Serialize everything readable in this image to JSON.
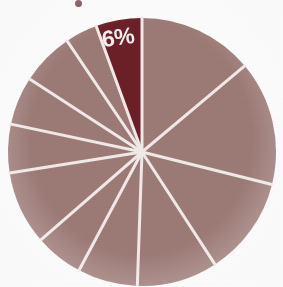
{
  "chart_data": {
    "type": "pie",
    "title": "",
    "subtitle": "",
    "xlabel": "",
    "ylabel": "",
    "legend_position": "none",
    "grid": false,
    "center": {
      "cx": 142,
      "cy": 152
    },
    "radius": 134,
    "slice_gap_color": "#f2ebe9",
    "slice_gap_width": 3,
    "categories": [
      "Slice 1",
      "Slice 2",
      "Slice 3",
      "Slice 4",
      "Slice 5",
      "Slice 6",
      "Slice 7",
      "Slice 8",
      "Slice 9",
      "Slice 10",
      "Slice 11",
      "Slice 12"
    ],
    "values": [
      14,
      15,
      12,
      10,
      7,
      6,
      9,
      6,
      6,
      7,
      6,
      6
    ],
    "labels": [
      "",
      "",
      "",
      "",
      "",
      "",
      "",
      "",
      "",
      "",
      "",
      "6%"
    ],
    "highlight_index": 11,
    "start_angle_deg": 0,
    "direction": "clockwise",
    "slices": [
      {
        "name": "Slice 1",
        "value": 14,
        "label": "",
        "start_deg": 0,
        "end_deg": 50,
        "color": "#9d7b77",
        "highlighted": false
      },
      {
        "name": "Slice 2",
        "value": 15,
        "label": "",
        "start_deg": 50,
        "end_deg": 104,
        "color": "#9d7b77",
        "highlighted": false
      },
      {
        "name": "Slice 3",
        "value": 12,
        "label": "",
        "start_deg": 104,
        "end_deg": 147,
        "color": "#9d7b77",
        "highlighted": false
      },
      {
        "name": "Slice 4",
        "value": 10,
        "label": "",
        "start_deg": 147,
        "end_deg": 182,
        "color": "#9d7b77",
        "highlighted": false
      },
      {
        "name": "Slice 5",
        "value": 7,
        "label": "",
        "start_deg": 182,
        "end_deg": 208,
        "color": "#9d7b77",
        "highlighted": false
      },
      {
        "name": "Slice 6",
        "value": 6,
        "label": "",
        "start_deg": 208,
        "end_deg": 229,
        "color": "#9d7b77",
        "highlighted": false
      },
      {
        "name": "Slice 7",
        "value": 9,
        "label": "",
        "start_deg": 229,
        "end_deg": 261,
        "color": "#9d7b77",
        "highlighted": false
      },
      {
        "name": "Slice 8",
        "value": 6,
        "label": "",
        "start_deg": 261,
        "end_deg": 282,
        "color": "#9d7b77",
        "highlighted": false
      },
      {
        "name": "Slice 9",
        "value": 6,
        "label": "",
        "start_deg": 282,
        "end_deg": 303,
        "color": "#9d7b77",
        "highlighted": false
      },
      {
        "name": "Slice 10",
        "value": 7,
        "label": "",
        "start_deg": 303,
        "end_deg": 326,
        "color": "#9d7b77",
        "highlighted": false
      },
      {
        "name": "Slice 11",
        "value": 6,
        "label": "",
        "start_deg": 326,
        "end_deg": 340,
        "color": "#9d7b77",
        "highlighted": false
      },
      {
        "name": "Slice 12",
        "value": 6,
        "label": "6%",
        "start_deg": 340,
        "end_deg": 360,
        "color": "#6b2028",
        "highlighted": true
      }
    ],
    "colors": {
      "primary_slice": "#9d7b77",
      "highlight_slice": "#6b2028",
      "separator": "#f2ebe9",
      "label_text": "#f4f0ef",
      "background": "#fdfdfd"
    },
    "annotations": [
      {
        "text": "6%",
        "x": 119,
        "y": 45,
        "color": "#f4f0ef"
      }
    ]
  },
  "artifacts": {
    "top_mark": {
      "name": "ink-speck",
      "x": 75,
      "y": 0
    }
  }
}
